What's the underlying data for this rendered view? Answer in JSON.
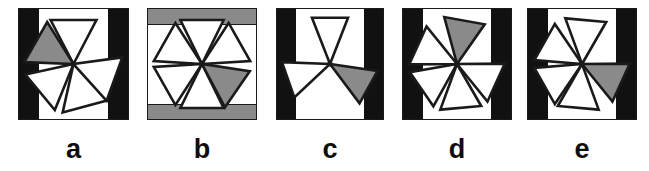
{
  "figure": {
    "width": 649,
    "height": 171,
    "background": "#ffffff",
    "colors": {
      "stroke": "#1a1a1a",
      "blade_fill": "#ffffff",
      "highlight_fill": "#8a8a8a",
      "bar_black": "#111111",
      "bar_gray": "#8a8a8a",
      "label": "#0d0d0d"
    }
  },
  "panels": [
    {
      "id": "a",
      "label": "a",
      "x": 18,
      "width": 111,
      "frame_style": "vertical-black-bars",
      "blade_count": 5,
      "highlighted_index": 1,
      "blade_angles": [
        -90,
        -150,
        140,
        75,
        20
      ],
      "blade_half_width": 21,
      "blade_length": 40
    },
    {
      "id": "b",
      "label": "b",
      "x": 147,
      "width": 110,
      "frame_style": "horizontal-gray-bars",
      "blade_count": 6,
      "highlighted_index": 4,
      "blade_angles": [
        -90,
        -150,
        150,
        90,
        35,
        -30
      ],
      "blade_half_width": 20,
      "blade_length": 40
    },
    {
      "id": "c",
      "label": "c",
      "x": 276,
      "width": 108,
      "frame_style": "vertical-black-bars",
      "blade_count": 3,
      "highlighted_index": 2,
      "blade_angles": [
        -90,
        160,
        30
      ],
      "blade_half_width": 17,
      "blade_length": 42
    },
    {
      "id": "d",
      "label": "d",
      "x": 402,
      "width": 110,
      "frame_style": "vertical-black-bars",
      "blade_count": 5,
      "highlighted_index": 0,
      "blade_angles": [
        -80,
        -155,
        145,
        85,
        25
      ],
      "blade_half_width": 19,
      "blade_length": 40
    },
    {
      "id": "e",
      "label": "e",
      "x": 527,
      "width": 110,
      "frame_style": "vertical-black-bars",
      "blade_count": 5,
      "highlighted_index": 4,
      "blade_angles": [
        -85,
        -150,
        150,
        95,
        25
      ],
      "blade_half_width": 19,
      "blade_length": 40
    }
  ]
}
